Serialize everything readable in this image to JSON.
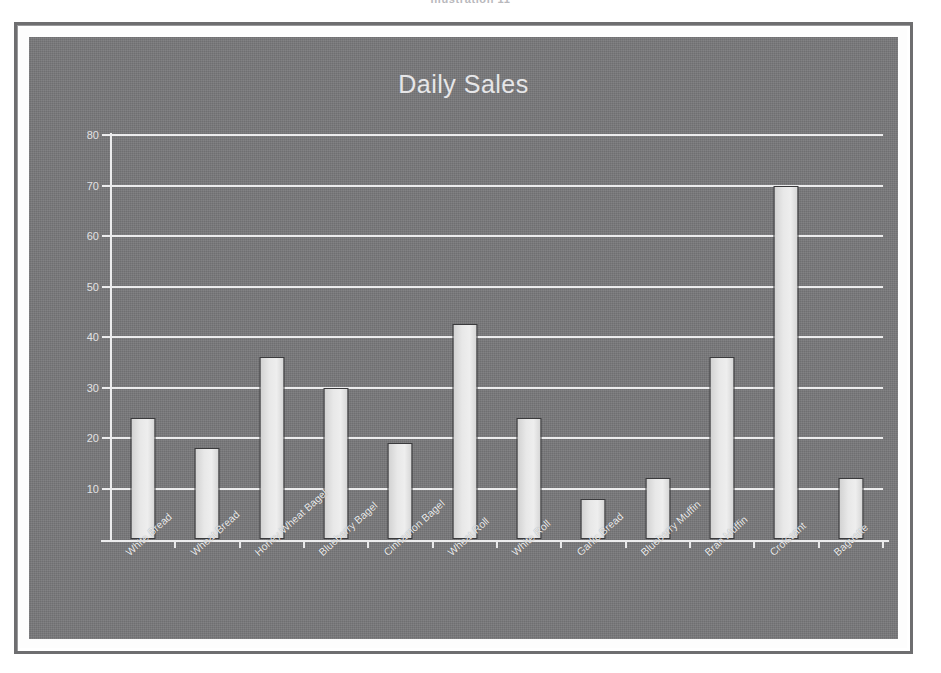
{
  "top_caption": "Illustration 11",
  "figure": {
    "frame_color": "#6e6e70",
    "canvas_color": "#777779",
    "bar_fill_color": "#e8e8e8",
    "bar_edge_color": "#3a3a3c",
    "grid_color": "#ececed",
    "text_color": "#ececed"
  },
  "chart_data": {
    "type": "bar",
    "title": "Daily Sales",
    "xlabel": "",
    "ylabel": "",
    "ylim": [
      0,
      80
    ],
    "yticks": [
      10,
      20,
      30,
      40,
      50,
      60,
      70,
      80
    ],
    "grid": true,
    "legend": false,
    "categories": [
      "White Bread",
      "Wheat Bread",
      "Honey Wheat Bagel",
      "Blueberry Bagel",
      "Cinnamon Bagel",
      "Wheat Roll",
      "White Roll",
      "Garlic Bread",
      "Blueberry Muffin",
      "Bran Muffin",
      "Croissant",
      "Baguette"
    ],
    "values": [
      24,
      18,
      36,
      30,
      19,
      42.5,
      24,
      8,
      12,
      36,
      70,
      12
    ]
  }
}
